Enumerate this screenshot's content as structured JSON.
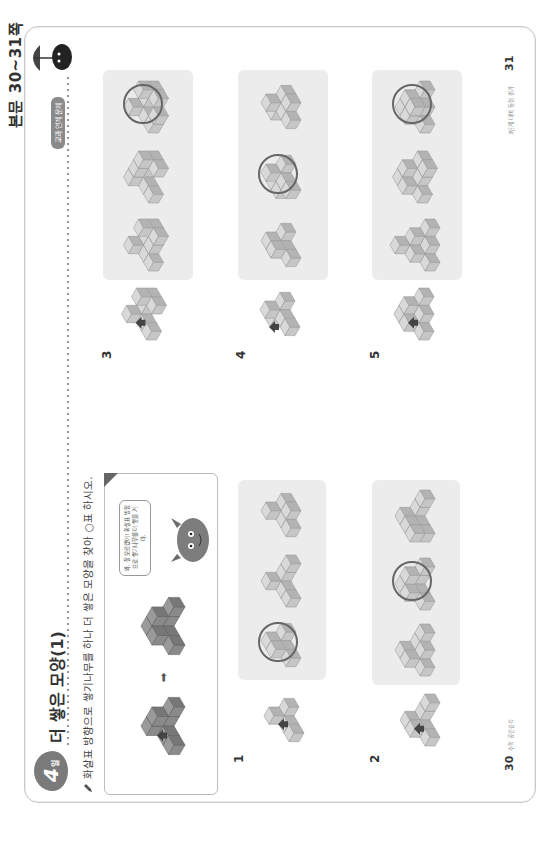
{
  "header": {
    "page_label": "본문 30~31쪽"
  },
  "left_page": {
    "day_badge": {
      "num": "4",
      "unit": "일"
    },
    "title": "더 쌓은 모양(1)",
    "instruction": "화살표 방향으로 쌓기나무를 하나 더 쌓은 모양을 찾아 ○표 하시오.",
    "example": {
      "bubble_text": "와, 잘 모르겠어! 화살표 방향으로 쌓기나무를 더 쌓을 거야."
    },
    "footer": {
      "page_number": "30",
      "text": "수학 공간감각"
    }
  },
  "right_page": {
    "tag": "교과 연계 문제",
    "footer": {
      "page_number": "31",
      "text": "3단계 대비 동형 평가"
    }
  },
  "colors": {
    "cube_top": "#d9d9d9",
    "cube_left": "#c6c6c6",
    "cube_right": "#b3b3b3",
    "cube_edge": "#9d9d9d",
    "example_top": "#9a9a9a",
    "example_left": "#8a8a8a",
    "example_right": "#777777",
    "panel_bg": "#ececec",
    "circle": "#666666"
  },
  "problems": [
    {
      "number": "1",
      "options": 3,
      "answer_index": 0
    },
    {
      "number": "2",
      "options": 3,
      "answer_index": 1
    },
    {
      "number": "3",
      "options": 3,
      "answer_index": 2
    },
    {
      "number": "4",
      "options": 3,
      "answer_index": 1
    },
    {
      "number": "5",
      "options": 3,
      "answer_index": 2
    }
  ],
  "shapes": {
    "ex_before": [
      [
        0,
        0,
        0
      ],
      [
        1,
        0,
        0
      ],
      [
        2,
        0,
        0
      ],
      [
        0,
        1,
        0
      ],
      [
        0,
        2,
        0
      ],
      [
        0,
        0,
        1
      ],
      [
        1,
        0,
        1
      ]
    ],
    "ex_after": [
      [
        0,
        0,
        0
      ],
      [
        1,
        0,
        0
      ],
      [
        2,
        0,
        0
      ],
      [
        0,
        1,
        0
      ],
      [
        0,
        2,
        0
      ],
      [
        0,
        0,
        1
      ],
      [
        1,
        0,
        1
      ],
      [
        0,
        1,
        1
      ]
    ],
    "p1_given": [
      [
        0,
        0,
        0
      ],
      [
        1,
        0,
        0
      ],
      [
        0,
        1,
        0
      ],
      [
        0,
        2,
        0
      ],
      [
        0,
        0,
        1
      ]
    ],
    "p1_opts": [
      [
        [
          0,
          0,
          0
        ],
        [
          1,
          0,
          0
        ],
        [
          0,
          1,
          0
        ],
        [
          0,
          2,
          0
        ],
        [
          0,
          0,
          1
        ],
        [
          0,
          1,
          1
        ]
      ],
      [
        [
          0,
          0,
          0
        ],
        [
          1,
          0,
          0
        ],
        [
          2,
          0,
          0
        ],
        [
          0,
          1,
          0
        ],
        [
          0,
          2,
          0
        ],
        [
          0,
          0,
          1
        ]
      ],
      [
        [
          0,
          0,
          0
        ],
        [
          1,
          0,
          0
        ],
        [
          0,
          1,
          0
        ],
        [
          1,
          1,
          0
        ],
        [
          0,
          2,
          0
        ],
        [
          0,
          0,
          1
        ]
      ]
    ],
    "p2_given": [
      [
        0,
        0,
        0
      ],
      [
        1,
        0,
        0
      ],
      [
        2,
        0,
        0
      ],
      [
        0,
        1,
        0
      ],
      [
        0,
        2,
        0
      ],
      [
        0,
        0,
        1
      ],
      [
        0,
        1,
        1
      ]
    ],
    "p2_opts": [
      [
        [
          0,
          0,
          0
        ],
        [
          1,
          0,
          0
        ],
        [
          2,
          0,
          0
        ],
        [
          0,
          1,
          0
        ],
        [
          0,
          2,
          0
        ],
        [
          0,
          0,
          1
        ],
        [
          0,
          1,
          1
        ],
        [
          1,
          1,
          0
        ]
      ],
      [
        [
          0,
          0,
          0
        ],
        [
          1,
          0,
          0
        ],
        [
          2,
          0,
          0
        ],
        [
          0,
          1,
          0
        ],
        [
          0,
          2,
          0
        ],
        [
          0,
          0,
          1
        ],
        [
          0,
          1,
          1
        ],
        [
          1,
          0,
          1
        ]
      ],
      [
        [
          0,
          0,
          0
        ],
        [
          1,
          0,
          0
        ],
        [
          2,
          0,
          0
        ],
        [
          0,
          1,
          0
        ],
        [
          0,
          2,
          0
        ],
        [
          0,
          0,
          1
        ],
        [
          0,
          1,
          1
        ],
        [
          0,
          2,
          1
        ]
      ]
    ],
    "p3_given": [
      [
        0,
        0,
        0
      ],
      [
        1,
        0,
        0
      ],
      [
        2,
        0,
        0
      ],
      [
        0,
        1,
        0
      ],
      [
        2,
        1,
        0
      ],
      [
        0,
        2,
        0
      ],
      [
        0,
        0,
        1
      ],
      [
        2,
        0,
        1
      ]
    ],
    "p3_opts": [
      [
        [
          0,
          0,
          0
        ],
        [
          1,
          0,
          0
        ],
        [
          2,
          0,
          0
        ],
        [
          0,
          1,
          0
        ],
        [
          2,
          1,
          0
        ],
        [
          0,
          2,
          0
        ],
        [
          0,
          0,
          1
        ],
        [
          2,
          0,
          1
        ],
        [
          1,
          1,
          0
        ]
      ],
      [
        [
          0,
          0,
          0
        ],
        [
          1,
          0,
          0
        ],
        [
          2,
          0,
          0
        ],
        [
          0,
          1,
          0
        ],
        [
          2,
          1,
          0
        ],
        [
          0,
          2,
          0
        ],
        [
          0,
          0,
          1
        ],
        [
          2,
          0,
          1
        ],
        [
          1,
          0,
          1
        ]
      ],
      [
        [
          0,
          0,
          0
        ],
        [
          1,
          0,
          0
        ],
        [
          2,
          0,
          0
        ],
        [
          0,
          1,
          0
        ],
        [
          2,
          1,
          0
        ],
        [
          0,
          2,
          0
        ],
        [
          0,
          0,
          1
        ],
        [
          2,
          0,
          1
        ],
        [
          1,
          2,
          0
        ]
      ]
    ],
    "p4_given": [
      [
        0,
        0,
        0
      ],
      [
        1,
        0,
        0
      ],
      [
        2,
        0,
        0
      ],
      [
        1,
        1,
        0
      ],
      [
        1,
        2,
        0
      ],
      [
        1,
        0,
        1
      ]
    ],
    "p4_opts": [
      [
        [
          0,
          0,
          0
        ],
        [
          1,
          0,
          0
        ],
        [
          2,
          0,
          0
        ],
        [
          1,
          1,
          0
        ],
        [
          1,
          2,
          0
        ],
        [
          1,
          0,
          1
        ],
        [
          1,
          1,
          1
        ]
      ],
      [
        [
          0,
          0,
          0
        ],
        [
          1,
          0,
          0
        ],
        [
          2,
          0,
          0
        ],
        [
          1,
          1,
          0
        ],
        [
          1,
          2,
          0
        ],
        [
          1,
          0,
          1
        ],
        [
          0,
          1,
          0
        ]
      ],
      [
        [
          0,
          0,
          0
        ],
        [
          1,
          0,
          0
        ],
        [
          2,
          0,
          0
        ],
        [
          1,
          1,
          0
        ],
        [
          1,
          2,
          0
        ],
        [
          1,
          0,
          1
        ],
        [
          2,
          1,
          0
        ]
      ]
    ],
    "p5_given": [
      [
        0,
        0,
        0
      ],
      [
        1,
        0,
        0
      ],
      [
        2,
        0,
        0
      ],
      [
        0,
        1,
        0
      ],
      [
        1,
        1,
        0
      ],
      [
        0,
        2,
        0
      ],
      [
        0,
        0,
        1
      ],
      [
        1,
        0,
        1
      ],
      [
        0,
        1,
        1
      ]
    ],
    "p5_opts": [
      [
        [
          0,
          0,
          0
        ],
        [
          1,
          0,
          0
        ],
        [
          2,
          0,
          0
        ],
        [
          0,
          1,
          0
        ],
        [
          1,
          1,
          0
        ],
        [
          0,
          2,
          0
        ],
        [
          0,
          0,
          1
        ],
        [
          1,
          0,
          1
        ],
        [
          0,
          1,
          1
        ],
        [
          0,
          0,
          2
        ]
      ],
      [
        [
          0,
          0,
          0
        ],
        [
          1,
          0,
          0
        ],
        [
          2,
          0,
          0
        ],
        [
          0,
          1,
          0
        ],
        [
          1,
          1,
          0
        ],
        [
          0,
          2,
          0
        ],
        [
          0,
          0,
          1
        ],
        [
          1,
          0,
          1
        ],
        [
          0,
          1,
          1
        ],
        [
          2,
          1,
          0
        ]
      ],
      [
        [
          0,
          0,
          0
        ],
        [
          1,
          0,
          0
        ],
        [
          2,
          0,
          0
        ],
        [
          0,
          1,
          0
        ],
        [
          1,
          1,
          0
        ],
        [
          0,
          2,
          0
        ],
        [
          0,
          0,
          1
        ],
        [
          1,
          0,
          1
        ],
        [
          0,
          1,
          1
        ],
        [
          1,
          1,
          1
        ]
      ]
    ]
  }
}
